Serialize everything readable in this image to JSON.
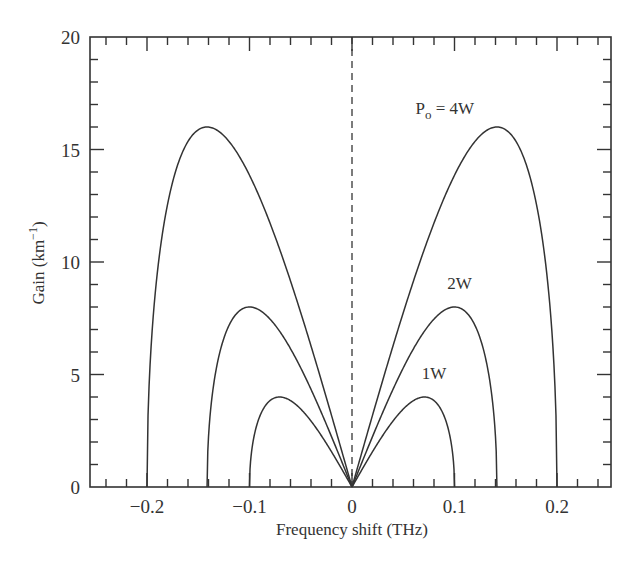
{
  "chart_data": {
    "type": "line",
    "title": "",
    "xlabel": "Frequency shift (THz)",
    "ylabel": "Gain (km",
    "ylabel_superscript": "−1",
    "ylabel_close": ")",
    "xlim": [
      -0.25,
      0.25
    ],
    "ylim": [
      0,
      20
    ],
    "x_ticks": [
      -0.2,
      -0.1,
      0,
      0.1,
      0.2
    ],
    "x_tick_labels": [
      "−0.2",
      "−0.1",
      "0",
      "0.1",
      "0.2"
    ],
    "x_minor_step": 0.02,
    "y_ticks": [
      0,
      5,
      10,
      15,
      20
    ],
    "y_tick_labels": [
      "0",
      "5",
      "10",
      "15",
      "20"
    ],
    "y_minor_step": 1,
    "grid": false,
    "legend": null,
    "reference_line": {
      "x": 0,
      "style": "dashed"
    },
    "series": [
      {
        "name": "1W",
        "power_W": 1,
        "cutoff_THz": 0.1,
        "peak_gain": 4.0,
        "peak_at_THz": 0.0707
      },
      {
        "name": "2W",
        "power_W": 2,
        "cutoff_THz": 0.1414,
        "peak_gain": 8.0,
        "peak_at_THz": 0.1
      },
      {
        "name": "4W",
        "power_W": 4,
        "cutoff_THz": 0.2,
        "peak_gain": 16.0,
        "peak_at_THz": 0.1414
      }
    ],
    "sample_points": {
      "x": [
        -0.2,
        -0.18,
        -0.16,
        -0.1414,
        -0.12,
        -0.1,
        -0.08,
        -0.0707,
        -0.06,
        -0.04,
        -0.02,
        0,
        0.02,
        0.04,
        0.06,
        0.0707,
        0.08,
        0.1,
        0.12,
        0.1414,
        0.16,
        0.18,
        0.2
      ],
      "4W": [
        0,
        13.9,
        15.4,
        16.0,
        15.6,
        14.0,
        11.7,
        10.6,
        9.2,
        6.3,
        3.2,
        0,
        3.2,
        6.3,
        9.2,
        10.6,
        11.7,
        14.0,
        15.6,
        16.0,
        15.4,
        13.9,
        0
      ],
      "2W": [
        null,
        null,
        null,
        0,
        5.8,
        8.0,
        7.5,
        7.07,
        6.3,
        4.6,
        2.4,
        0,
        2.4,
        4.6,
        6.3,
        7.07,
        7.5,
        8.0,
        5.8,
        0,
        null,
        null,
        null
      ],
      "1W": [
        null,
        null,
        null,
        null,
        null,
        0,
        3.84,
        4.0,
        3.84,
        2.9,
        1.6,
        0,
        1.6,
        2.9,
        3.84,
        4.0,
        3.84,
        0,
        null,
        null,
        null,
        null,
        null
      ]
    },
    "annotations": [
      {
        "text_main": "P",
        "text_sub": "o",
        "text_rest": " = 4W",
        "x": 0.062,
        "y": 16.6
      },
      {
        "text_main": "2W",
        "x": 0.093,
        "y": 8.8
      },
      {
        "text_main": "1W",
        "x": 0.068,
        "y": 4.8
      }
    ]
  }
}
